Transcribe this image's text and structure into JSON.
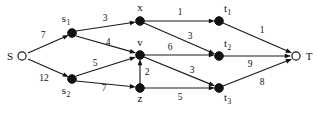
{
  "figure": {
    "type": "directed-flow-network",
    "background_color": "#ffffff",
    "stroke_color": "#111111",
    "width": 319,
    "height": 114
  },
  "nodes": [
    {
      "id": "S",
      "label": "S",
      "subscript": "",
      "style": "hollow",
      "x": 296,
      "y": 56,
      "cx": 22,
      "cy": 56,
      "label_x": 10,
      "label_y": 60,
      "label_anchor": "middle"
    },
    {
      "id": "s1",
      "label": "s",
      "subscript": "1",
      "style": "filled",
      "cx": 72,
      "cy": 33,
      "label_x": 66,
      "label_y": 22,
      "label_anchor": "middle"
    },
    {
      "id": "s2",
      "label": "s",
      "subscript": "2",
      "style": "filled",
      "cx": 72,
      "cy": 79,
      "label_x": 66,
      "label_y": 94,
      "label_anchor": "middle"
    },
    {
      "id": "x",
      "label": "x",
      "subscript": "",
      "style": "filled",
      "cx": 140,
      "cy": 21,
      "label_x": 140,
      "label_y": 11,
      "label_anchor": "middle"
    },
    {
      "id": "v",
      "label": "v",
      "subscript": "",
      "style": "filled",
      "cx": 140,
      "cy": 55,
      "label_x": 140,
      "label_y": 46,
      "label_anchor": "middle"
    },
    {
      "id": "z",
      "label": "z",
      "subscript": "",
      "style": "filled",
      "cx": 140,
      "cy": 88,
      "label_x": 140,
      "label_y": 102,
      "label_anchor": "middle"
    },
    {
      "id": "t1",
      "label": "t",
      "subscript": "1",
      "style": "filled",
      "cx": 219,
      "cy": 21,
      "label_x": 224,
      "label_y": 12,
      "label_anchor": "start"
    },
    {
      "id": "t2",
      "label": "t",
      "subscript": "2",
      "style": "filled",
      "cx": 219,
      "cy": 56,
      "label_x": 224,
      "label_y": 47,
      "label_anchor": "start"
    },
    {
      "id": "t3",
      "label": "t",
      "subscript": "3",
      "style": "filled",
      "cx": 219,
      "cy": 88,
      "label_x": 224,
      "label_y": 101,
      "label_anchor": "start"
    },
    {
      "id": "T",
      "label": "T",
      "subscript": "",
      "style": "hollow",
      "cx": 296,
      "cy": 56,
      "label_x": 309,
      "label_y": 60,
      "label_anchor": "middle"
    }
  ],
  "edges": [
    {
      "from": "S",
      "to": "s1",
      "weight": "7",
      "x1": 28,
      "y1": 53,
      "x2": 69,
      "y2": 35,
      "label_x": 43,
      "label_y": 38
    },
    {
      "from": "S",
      "to": "s2",
      "weight": "12",
      "x1": 28,
      "y1": 59,
      "x2": 69,
      "y2": 77,
      "label_x": 44,
      "label_y": 81
    },
    {
      "from": "s1",
      "to": "x",
      "weight": "3",
      "x1": 76,
      "y1": 31,
      "x2": 136,
      "y2": 22,
      "label_x": 105,
      "label_y": 21
    },
    {
      "from": "s1",
      "to": "v",
      "weight": "4",
      "x1": 76,
      "y1": 36,
      "x2": 136,
      "y2": 53,
      "label_x": 108,
      "label_y": 45
    },
    {
      "from": "s2",
      "to": "v",
      "weight": "5",
      "x1": 76,
      "y1": 76,
      "x2": 136,
      "y2": 57,
      "label_x": 95,
      "label_y": 66
    },
    {
      "from": "s2",
      "to": "z",
      "weight": "7",
      "x1": 76,
      "y1": 81,
      "x2": 136,
      "y2": 87,
      "label_x": 104,
      "label_y": 91
    },
    {
      "from": "z",
      "to": "v",
      "weight": "2",
      "x1": 140,
      "y1": 84,
      "x2": 140,
      "y2": 59,
      "label_x": 147,
      "label_y": 75
    },
    {
      "from": "x",
      "to": "t1",
      "weight": "1",
      "x1": 144,
      "y1": 21,
      "x2": 215,
      "y2": 21,
      "label_x": 180,
      "label_y": 15
    },
    {
      "from": "x",
      "to": "t2",
      "weight": "3",
      "x1": 144,
      "y1": 23,
      "x2": 215,
      "y2": 54,
      "label_x": 190,
      "label_y": 39
    },
    {
      "from": "v",
      "to": "t2",
      "weight": "6",
      "x1": 144,
      "y1": 55,
      "x2": 215,
      "y2": 55,
      "label_x": 170,
      "label_y": 50
    },
    {
      "from": "v",
      "to": "t3",
      "weight": "3",
      "x1": 144,
      "y1": 57,
      "x2": 215,
      "y2": 86,
      "label_x": 192,
      "label_y": 73
    },
    {
      "from": "z",
      "to": "t3",
      "weight": "5",
      "x1": 144,
      "y1": 88,
      "x2": 215,
      "y2": 88,
      "label_x": 180,
      "label_y": 100
    },
    {
      "from": "t1",
      "to": "T",
      "weight": "1",
      "x1": 223,
      "y1": 23,
      "x2": 292,
      "y2": 53,
      "label_x": 262,
      "label_y": 33
    },
    {
      "from": "t2",
      "to": "T",
      "weight": "9",
      "x1": 223,
      "y1": 56,
      "x2": 291,
      "y2": 56,
      "label_x": 250,
      "label_y": 67
    },
    {
      "from": "t3",
      "to": "T",
      "weight": "8",
      "x1": 223,
      "y1": 86,
      "x2": 292,
      "y2": 59,
      "label_x": 262,
      "label_y": 85
    }
  ]
}
